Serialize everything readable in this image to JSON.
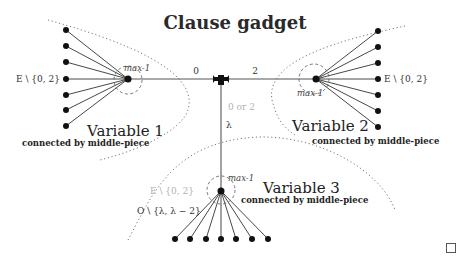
{
  "diagram": {
    "title": "Clause gadget",
    "clause_node": {
      "edge_left_label": "0",
      "edge_right_label": "2",
      "edge_down_label_top": "0 or 2",
      "edge_down_label_bottom": "λ"
    },
    "variables": [
      {
        "name": "Variable 1",
        "subtitle": "connected by middle-piece",
        "hub_label": "max-1",
        "leaf_label": "E \\ {0, 2}",
        "leaf_count": 7
      },
      {
        "name": "Variable 2",
        "subtitle": "connected by middle-piece",
        "hub_label": "max-1",
        "leaf_label": "E \\ {0, 2}",
        "leaf_count": 7
      },
      {
        "name": "Variable 3",
        "subtitle": "connected by middle-piece",
        "hub_label": "max-1",
        "leaf_label_faded": "E \\ {0, 2}",
        "leaf_label": "O \\ {λ, λ − 2}",
        "leaf_count": 7
      }
    ],
    "colors": {
      "node": "#111111",
      "edge": "#333333",
      "faded_text": "#b0b0b0",
      "dotted_boundary": "#777777"
    }
  },
  "footer": {
    "end_of_proof_symbol": "□"
  }
}
